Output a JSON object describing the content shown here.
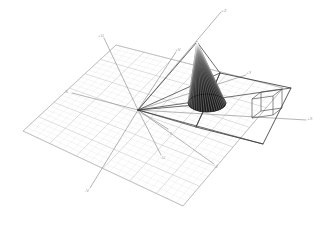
{
  "figure": {
    "background_color": "#ffffff",
    "width": 329,
    "height": 243
  },
  "colors": {
    "background": "#ffffff",
    "grid_minor": "#dcdcdc",
    "grid_major": "#c2c2c2",
    "grid_plane_edge": "#b4b4b4",
    "axis_line": "#8d8d8d",
    "axis_label": "#9a9a9a",
    "ray": "#3c3c3c",
    "cone_fill": "#1a1a1a",
    "cone_stripe": "#ffffff",
    "cone_outline": "#111111",
    "plane_edge": "#2f2f2f",
    "cube_edge": "#4a4a4a"
  },
  "axes": {
    "origin": {
      "x": 138,
      "y": 110,
      "label": "O"
    },
    "items": [
      {
        "name": "x-positive",
        "label": "+X",
        "end_x": 306,
        "end_y": 120,
        "label_x": 310,
        "label_y": 119
      },
      {
        "name": "x-negative",
        "label": "-X",
        "end_x": 72,
        "end_y": 93,
        "label_x": 66,
        "label_y": 92
      },
      {
        "name": "y-positive",
        "label": "+Y",
        "end_x": 246,
        "end_y": 75,
        "label_x": 249,
        "label_y": 73
      },
      {
        "name": "y-negative",
        "label": "-Y",
        "end_x": 168,
        "end_y": 129,
        "label_x": 170,
        "label_y": 134
      },
      {
        "name": "z-positive",
        "label": "+Z",
        "end_x": 221,
        "end_y": 12,
        "label_x": 224,
        "label_y": 11
      },
      {
        "name": "z-negative",
        "label": "-Z",
        "end_x": 214,
        "end_y": 164,
        "label_x": 216,
        "label_y": 167
      },
      {
        "name": "u-positive",
        "label": "+U",
        "end_x": 104,
        "end_y": 38,
        "label_x": 101,
        "label_y": 36
      },
      {
        "name": "u-negative",
        "label": "-U",
        "end_x": 161,
        "end_y": 155,
        "label_x": 163,
        "label_y": 158
      },
      {
        "name": "v-positive",
        "label": "+V",
        "end_x": 176,
        "end_y": 52,
        "label_x": 178,
        "label_y": 50
      },
      {
        "name": "v-negative",
        "label": "-V",
        "end_x": 90,
        "end_y": 188,
        "label_x": 87,
        "label_y": 191
      }
    ]
  },
  "grid": {
    "type": "ground-plane",
    "minor_divisions": 24,
    "major_every": 4,
    "corners": [
      {
        "x": 23,
        "y": 131
      },
      {
        "x": 116,
        "y": 45
      },
      {
        "x": 283,
        "y": 88
      },
      {
        "x": 183,
        "y": 206
      }
    ]
  },
  "cone": {
    "name": "striped-cone",
    "apex": {
      "x": 197,
      "y": 42
    },
    "base_center": {
      "x": 207,
      "y": 104
    },
    "base_rx": 19,
    "base_ry": 9,
    "meridian_count": 22,
    "filled": true
  },
  "projection_plane": {
    "name": "image-plane-quad",
    "corners": [
      {
        "x": 220,
        "y": 73
      },
      {
        "x": 291,
        "y": 88
      },
      {
        "x": 263,
        "y": 144
      },
      {
        "x": 196,
        "y": 127
      }
    ]
  },
  "cube": {
    "name": "wireframe-cube",
    "front_face": [
      {
        "x": 252,
        "y": 99
      },
      {
        "x": 273,
        "y": 96
      },
      {
        "x": 273,
        "y": 115
      },
      {
        "x": 252,
        "y": 118
      }
    ],
    "depth_dx": 9,
    "depth_dy": 7
  },
  "rays": {
    "description": "projection rays from origin to plane and cone",
    "lines": [
      {
        "name": "ray-origin-to-plane-top",
        "x1": 138,
        "y1": 110,
        "x2": 220,
        "y2": 73
      },
      {
        "name": "ray-origin-to-plane-right",
        "x1": 138,
        "y1": 110,
        "x2": 291,
        "y2": 88
      },
      {
        "name": "ray-origin-to-plane-bottom",
        "x1": 138,
        "y1": 110,
        "x2": 263,
        "y2": 144
      },
      {
        "name": "ray-origin-to-plane-left",
        "x1": 138,
        "y1": 110,
        "x2": 196,
        "y2": 127
      },
      {
        "name": "ray-origin-to-cone-apex",
        "x1": 138,
        "y1": 110,
        "x2": 197,
        "y2": 42
      },
      {
        "name": "ray-origin-to-cone-base",
        "x1": 138,
        "y1": 110,
        "x2": 207,
        "y2": 104
      },
      {
        "name": "ray-plane-top-to-cone-apex",
        "x1": 220,
        "y1": 73,
        "x2": 197,
        "y2": 42
      },
      {
        "name": "ray-plane-top-to-cone-base",
        "x1": 220,
        "y1": 73,
        "x2": 207,
        "y2": 104
      },
      {
        "name": "ray-plane-left-to-cone",
        "x1": 196,
        "y1": 127,
        "x2": 207,
        "y2": 104
      }
    ]
  }
}
